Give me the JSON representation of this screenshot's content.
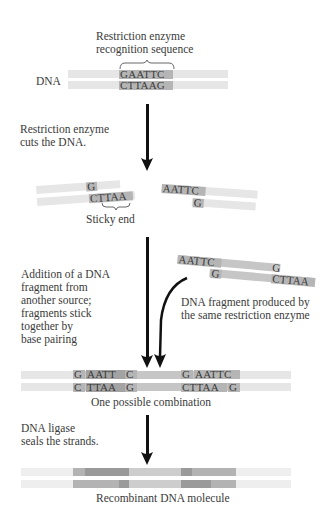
{
  "labels": {
    "recognition_line1": "Restriction enzyme",
    "recognition_line2": "recognition sequence",
    "dna": "DNA",
    "step1_line1": "Restriction enzyme",
    "step1_line2": "cuts the DNA.",
    "sticky_end": "Sticky end",
    "step2_lines": [
      "Addition of a DNA",
      "fragment from",
      "another source;",
      "fragments stick",
      "together by",
      "base pairing"
    ],
    "fragment_line1": "DNA fragment produced by",
    "fragment_line2": "the same restriction enzyme",
    "combination": "One possible combination",
    "step3_line1": "DNA ligase",
    "step3_line2": "seals the strands.",
    "recombinant": "Recombinant DNA molecule"
  },
  "sequences": {
    "original_top": "GAATTC",
    "original_bottom": "CTTAAG",
    "cut_left_top": "G",
    "cut_left_bottom": "CTTAA",
    "cut_right_top": "AATTC",
    "cut_right_bottom": "G",
    "fragment_left_top": "AATTC",
    "fragment_left_bottom": "G",
    "fragment_right_top": "G",
    "fragment_right_bottom": "CTTAA",
    "combo_top_1": "G",
    "combo_top_2": "AATT",
    "combo_top_3": "C",
    "combo_top_4": "G",
    "combo_top_5": "AATTC",
    "combo_bottom_1": "C",
    "combo_bottom_2": "TTAA",
    "combo_bottom_3": "G",
    "combo_bottom_4": "CTTAA",
    "combo_bottom_5": "G"
  },
  "colors": {
    "strand_light": "#e6e6e6",
    "seq_mid": "#b5b5b5",
    "seq_dark": "#a3a3a3",
    "arrow": "#111111"
  }
}
